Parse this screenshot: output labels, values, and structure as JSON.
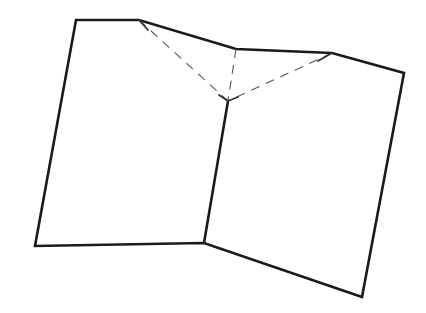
{
  "diagram": {
    "title": "",
    "colors": {
      "background": "#ffffff",
      "solid_stroke": "#1a1a1a",
      "dashed_stroke": "#555555"
    },
    "outline_points": "76,20 139,20 236,49 332,53 404,73 362,297 204,243 35,246",
    "spine": {
      "x1": 228,
      "y1": 101,
      "x2": 204,
      "y2": 243
    },
    "fold_lines": [
      {
        "name": "fold-left",
        "x1": 139,
        "y1": 20,
        "x2": 228,
        "y2": 101
      },
      {
        "name": "fold-center",
        "x1": 236,
        "y1": 49,
        "x2": 228,
        "y2": 101
      },
      {
        "name": "fold-right",
        "x1": 332,
        "y1": 53,
        "x2": 228,
        "y2": 101
      }
    ],
    "ticks": [
      {
        "name": "tick-left-top",
        "x1": 139,
        "y1": 20,
        "x2": 148,
        "y2": 30
      },
      {
        "name": "tick-right-top",
        "x1": 332,
        "y1": 53,
        "x2": 318,
        "y2": 61
      },
      {
        "name": "tick-spine-left",
        "x1": 228,
        "y1": 101,
        "x2": 219,
        "y2": 95
      },
      {
        "name": "tick-spine-right",
        "x1": 228,
        "y1": 101,
        "x2": 238,
        "y2": 97
      }
    ]
  }
}
